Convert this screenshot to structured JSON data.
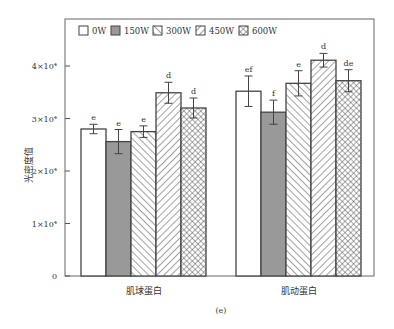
{
  "chart_data": {
    "type": "bar",
    "title": "",
    "caption": "(e)",
    "xlabel": "",
    "ylabel": "光密度值",
    "ylim": [
      0,
      48000
    ],
    "yticks": [
      0,
      10000,
      20000,
      30000,
      40000
    ],
    "ytick_labels": [
      "0",
      "1×10⁴",
      "2×10⁴",
      "3×10⁴",
      "4×10⁴"
    ],
    "categories": [
      "肌球蛋白",
      "肌动蛋白"
    ],
    "legend_position": "top-left inside",
    "grid": false,
    "series": [
      {
        "name": "0W",
        "pattern": "white",
        "values": [
          28000,
          35200
        ],
        "errors": [
          900,
          2900
        ],
        "letters": [
          "e",
          "ef"
        ]
      },
      {
        "name": "150W",
        "pattern": "gray",
        "values": [
          25600,
          31200
        ],
        "errors": [
          2300,
          2300
        ],
        "letters": [
          "e",
          "f"
        ]
      },
      {
        "name": "300W",
        "pattern": "forward-hatch",
        "values": [
          27500,
          36700
        ],
        "errors": [
          1100,
          2400
        ],
        "letters": [
          "e",
          "e"
        ]
      },
      {
        "name": "450W",
        "pattern": "back-hatch",
        "values": [
          34900,
          41100
        ],
        "errors": [
          2000,
          1300
        ],
        "letters": [
          "d",
          "d"
        ]
      },
      {
        "name": "600W",
        "pattern": "crosshatch",
        "values": [
          32000,
          37200
        ],
        "errors": [
          1900,
          2100
        ],
        "letters": [
          "d",
          "de"
        ]
      }
    ]
  }
}
